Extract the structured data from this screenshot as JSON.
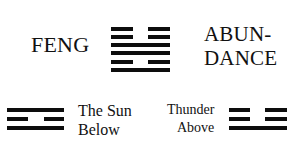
{
  "hexagram": {
    "name": "FENG",
    "meaning_line1": "ABUN-",
    "meaning_line2": "DANCE",
    "lines_top_to_bottom": [
      "broken",
      "broken",
      "solid",
      "solid",
      "broken",
      "solid"
    ]
  },
  "lower_trigram": {
    "caption_line1": "The Sun",
    "caption_line2": "Below",
    "lines_top_to_bottom": [
      "solid",
      "broken",
      "solid"
    ]
  },
  "upper_trigram": {
    "caption_line1": "Thunder",
    "caption_line2": "Above",
    "lines_top_to_bottom": [
      "broken",
      "broken",
      "solid"
    ]
  },
  "colors": {
    "ink": "#0d0d0d",
    "background": "#ffffff"
  }
}
